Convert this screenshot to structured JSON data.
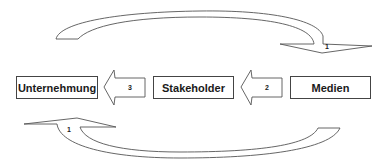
{
  "diagram": {
    "nodes": [
      {
        "id": "unternehmung",
        "label": "Unternehmung"
      },
      {
        "id": "stakeholder",
        "label": "Stakeholder"
      },
      {
        "id": "medien",
        "label": "Medien"
      }
    ],
    "edges": [
      {
        "id": "arrow-3",
        "from": "stakeholder",
        "to": "unternehmung",
        "label": "3",
        "style": "block-arrow"
      },
      {
        "id": "arrow-2",
        "from": "medien",
        "to": "stakeholder",
        "label": "2",
        "style": "block-arrow"
      },
      {
        "id": "arrow-1-top",
        "from": "unternehmung",
        "to": "medien",
        "label": "1",
        "style": "curved-arrow-over"
      },
      {
        "id": "arrow-1-bottom",
        "from": "medien",
        "to": "unternehmung",
        "label": "1",
        "style": "curved-arrow-under"
      }
    ],
    "colors": {
      "stroke": "#444444",
      "fill": "#ffffff",
      "text": "#1a1a1a"
    }
  }
}
